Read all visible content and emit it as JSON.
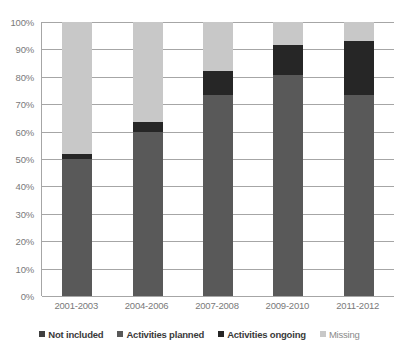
{
  "chart_data": {
    "type": "bar",
    "stacked": true,
    "title": "",
    "subtitle": "",
    "xlabel": "",
    "ylabel": "",
    "ylim": [
      0,
      100
    ],
    "ytick_labels": [
      "100%",
      "90%",
      "80%",
      "70%",
      "60%",
      "50%",
      "40%",
      "30%",
      "20%",
      "10%",
      "0%"
    ],
    "ytick_values": [
      100,
      90,
      80,
      70,
      60,
      50,
      40,
      30,
      20,
      10,
      0
    ],
    "grid": true,
    "legend_position": "bottom",
    "categories": [
      "2001-2003",
      "2004-2006",
      "2007-2008",
      "2009-2010",
      "2011-2012"
    ],
    "series": [
      {
        "name": "Not included",
        "color": "#404040",
        "values": [
          0,
          0,
          0,
          0,
          0
        ]
      },
      {
        "name": "Activities planned",
        "color": "#595959",
        "values": [
          50,
          60,
          73.5,
          80.5,
          73.5
        ]
      },
      {
        "name": "Activities ongoing",
        "color": "#262626",
        "values": [
          2,
          3.5,
          8.5,
          11,
          19.5
        ]
      },
      {
        "name": "Missing",
        "color": "#c8c8c8",
        "values": [
          48,
          36.5,
          18,
          8.5,
          7
        ]
      }
    ]
  },
  "colors": {
    "gridline": "#a6a6a6",
    "axis_text": "#7a7a7a",
    "legend_text": "#3a3a3a",
    "background": "#ffffff"
  }
}
